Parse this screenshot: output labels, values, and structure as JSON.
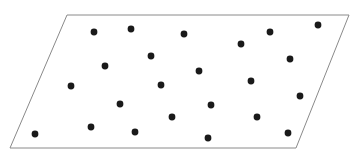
{
  "figure": {
    "canvas": {
      "width": 358,
      "height": 155,
      "background": "#ffffff"
    },
    "shape": {
      "name": "parallelogram",
      "stroke_color": "#8a8a8a",
      "stroke_width": 1,
      "fill_color": "#ffffff",
      "vertices": [
        {
          "label": "top-left",
          "x": 67,
          "y": 15
        },
        {
          "label": "top-right",
          "x": 349,
          "y": 15
        },
        {
          "label": "bottom-right",
          "x": 296,
          "y": 148
        },
        {
          "label": "bottom-left",
          "x": 10,
          "y": 148
        }
      ],
      "points_path": "67,15 349,15 296,148 10,148"
    },
    "dots": {
      "count": 22,
      "color": "#1a1a1a",
      "radius": 3.4,
      "points": [
        {
          "x": 94,
          "y": 32
        },
        {
          "x": 131,
          "y": 29
        },
        {
          "x": 184,
          "y": 34
        },
        {
          "x": 270,
          "y": 32
        },
        {
          "x": 318,
          "y": 25
        },
        {
          "x": 241,
          "y": 44
        },
        {
          "x": 151,
          "y": 56
        },
        {
          "x": 290,
          "y": 59
        },
        {
          "x": 105,
          "y": 66
        },
        {
          "x": 199,
          "y": 71
        },
        {
          "x": 251,
          "y": 81
        },
        {
          "x": 71,
          "y": 86
        },
        {
          "x": 161,
          "y": 85
        },
        {
          "x": 300,
          "y": 96
        },
        {
          "x": 120,
          "y": 104
        },
        {
          "x": 211,
          "y": 105
        },
        {
          "x": 172,
          "y": 117
        },
        {
          "x": 257,
          "y": 117
        },
        {
          "x": 91,
          "y": 127
        },
        {
          "x": 288,
          "y": 133
        },
        {
          "x": 135,
          "y": 132
        },
        {
          "x": 35,
          "y": 134
        },
        {
          "x": 208,
          "y": 138
        }
      ]
    }
  }
}
